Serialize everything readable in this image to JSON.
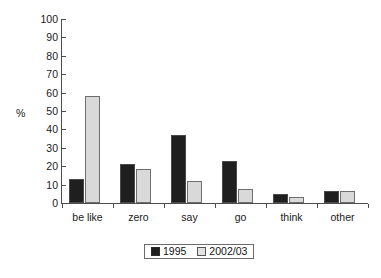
{
  "chart_data": {
    "type": "bar",
    "title": "",
    "subtitle": "",
    "xlabel": "",
    "ylabel": "%",
    "ylim": [
      0,
      100
    ],
    "ytick_step": 10,
    "yticks": [
      100,
      90,
      80,
      70,
      60,
      50,
      40,
      30,
      20,
      10,
      0
    ],
    "grid": false,
    "legend_position": "bottom-center",
    "categories": [
      "be like",
      "zero",
      "say",
      "go",
      "think",
      "other"
    ],
    "series": [
      {
        "name": "1995",
        "color": "#1f1f1f",
        "values": [
          13,
          21,
          37,
          23,
          5,
          6.5
        ]
      },
      {
        "name": "2002/03",
        "color": "#d9d9d9",
        "values": [
          58,
          18.5,
          12,
          7.5,
          3.5,
          6.5
        ]
      }
    ]
  },
  "legend": {
    "entries": [
      {
        "label": "1995",
        "swatch": "dark-square-swatch"
      },
      {
        "label": "2002/03",
        "swatch": "light-square-swatch"
      }
    ]
  },
  "axes": {
    "y_label": "%",
    "y_tick_labels": [
      "100",
      "90",
      "80",
      "70",
      "60",
      "50",
      "40",
      "30",
      "20",
      "10",
      "0"
    ],
    "x_tick_labels": [
      "be like",
      "zero",
      "say",
      "go",
      "think",
      "other"
    ]
  }
}
